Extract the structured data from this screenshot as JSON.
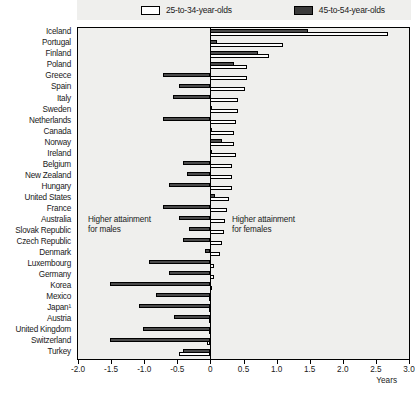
{
  "legend": {
    "items": [
      {
        "label": "25-to-34-year-olds",
        "swatch": "light",
        "color": "#ffffff"
      },
      {
        "label": "45-to-54-year-olds",
        "swatch": "dark",
        "color": "#3a3a3a"
      }
    ]
  },
  "annotations": {
    "males": "Higher attainment\nfor males",
    "females": "Higher attainment\nfor females"
  },
  "axis": {
    "title": "Years",
    "ticks": [
      "-2.0",
      "-1.5",
      "-1.0",
      "-0.5",
      "0",
      "0.5",
      "1.0",
      "1.5",
      "2.0",
      "2.5",
      "3.0"
    ]
  },
  "chart_data": {
    "type": "bar",
    "orientation": "horizontal",
    "title": "",
    "xlabel": "Years",
    "ylabel": "",
    "xlim": [
      -2.0,
      3.0
    ],
    "xticks": [
      -2.0,
      -1.5,
      -1.0,
      -0.5,
      0,
      0.5,
      1.0,
      1.5,
      2.0,
      2.5,
      3.0
    ],
    "grid": false,
    "legend_position": "top",
    "annotations": [
      "Higher attainment for males",
      "Higher attainment for females"
    ],
    "categories": [
      "Iceland",
      "Portugal",
      "Finland",
      "Poland",
      "Greece",
      "Spain",
      "Italy",
      "Sweden",
      "Netherlands",
      "Canada",
      "Norway",
      "Ireland",
      "Belgium",
      "New Zealand",
      "Hungary",
      "United States",
      "France",
      "Australia",
      "Slovak Republic",
      "Czech Republic",
      "Denmark",
      "Luxembourg",
      "Germany",
      "Korea",
      "Mexico",
      "Japan¹",
      "Austria",
      "United Kingdom",
      "Switzerland",
      "Turkey"
    ],
    "series": [
      {
        "name": "45-to-54-year-olds",
        "color": "#4a4a4a",
        "values": [
          1.48,
          0.1,
          0.72,
          0.35,
          -0.72,
          -0.47,
          -0.57,
          0.0,
          -0.72,
          0.0,
          0.18,
          0.0,
          -0.42,
          -0.35,
          -0.62,
          0.07,
          -0.72,
          -0.47,
          -0.32,
          -0.42,
          -0.08,
          -0.92,
          -0.62,
          -1.52,
          -0.82,
          -1.08,
          -0.55,
          -1.02,
          -1.52,
          -0.42
        ]
      },
      {
        "name": "25-to-34-year-olds",
        "color": "#fdfdfd",
        "values": [
          2.68,
          1.1,
          0.88,
          0.55,
          0.55,
          0.52,
          0.42,
          0.42,
          0.38,
          0.35,
          0.35,
          0.38,
          0.32,
          0.32,
          0.32,
          0.28,
          0.25,
          0.22,
          0.2,
          0.18,
          0.15,
          0.05,
          0.05,
          0.02,
          -0.02,
          -0.02,
          -0.02,
          -0.02,
          -0.05,
          -0.48
        ]
      }
    ]
  }
}
